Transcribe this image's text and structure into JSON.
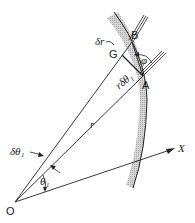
{
  "diagram": {
    "type": "geometry",
    "labels": {
      "origin": "O",
      "axis": "X",
      "point_a": "A",
      "point_b": "B",
      "point_g": "G",
      "radius": "r",
      "arc_length": "rδθ₁",
      "delta_r": "δr",
      "delta_theta": "δθ₁",
      "theta": "θ₁",
      "phi": "φ"
    },
    "colors": {
      "line": "#222222",
      "shading": "#bdbdbd"
    }
  }
}
